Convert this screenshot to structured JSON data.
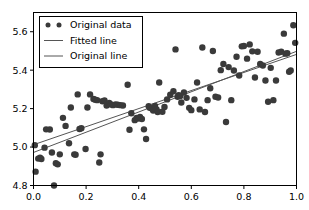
{
  "chart_data": {
    "type": "scatter",
    "title": "",
    "xlabel": "",
    "ylabel": "",
    "xlim": [
      0.0,
      1.0
    ],
    "ylim": [
      4.8,
      5.7
    ],
    "grid": false,
    "legend_position": "upper left",
    "xticks": [
      "0.0",
      "0.2",
      "0.4",
      "0.6",
      "0.8",
      "1.0"
    ],
    "xtick_values": [
      0.0,
      0.2,
      0.4,
      0.6,
      0.8,
      1.0
    ],
    "yticks": [
      "4.8",
      "5.0",
      "5.2",
      "5.4",
      "5.6"
    ],
    "ytick_values": [
      4.8,
      5.0,
      5.2,
      5.4,
      5.6
    ],
    "marker_color": "#3a3a3a",
    "marker_size": 4.2,
    "line_color": "#555555",
    "series": [
      {
        "name": "Original data",
        "type": "scatter",
        "marker": "circle",
        "color": "#3a3a3a",
        "points": [
          [
            0.005,
            5.01
          ],
          [
            0.008,
            4.872
          ],
          [
            0.018,
            4.94
          ],
          [
            0.025,
            4.945
          ],
          [
            0.03,
            4.938
          ],
          [
            0.042,
            4.997
          ],
          [
            0.048,
            5.092
          ],
          [
            0.062,
            5.091
          ],
          [
            0.07,
            4.972
          ],
          [
            0.078,
            4.8
          ],
          [
            0.085,
            4.916
          ],
          [
            0.092,
            4.91
          ],
          [
            0.1,
            4.962
          ],
          [
            0.112,
            5.152
          ],
          [
            0.122,
            5.11
          ],
          [
            0.135,
            5.02
          ],
          [
            0.142,
            5.206
          ],
          [
            0.155,
            4.962
          ],
          [
            0.16,
            4.96
          ],
          [
            0.168,
            5.274
          ],
          [
            0.175,
            5.094
          ],
          [
            0.182,
            5.098
          ],
          [
            0.198,
            4.99
          ],
          [
            0.205,
            5.206
          ],
          [
            0.215,
            5.274
          ],
          [
            0.228,
            5.25
          ],
          [
            0.235,
            5.246
          ],
          [
            0.242,
            5.244
          ],
          [
            0.25,
            4.92
          ],
          [
            0.255,
            4.962
          ],
          [
            0.262,
            5.238
          ],
          [
            0.27,
            5.242
          ],
          [
            0.278,
            5.216
          ],
          [
            0.288,
            5.23
          ],
          [
            0.295,
            5.222
          ],
          [
            0.302,
            5.218
          ],
          [
            0.312,
            5.222
          ],
          [
            0.32,
            5.22
          ],
          [
            0.33,
            5.218
          ],
          [
            0.34,
            5.216
          ],
          [
            0.358,
            5.324
          ],
          [
            0.365,
            5.09
          ],
          [
            0.372,
            5.176
          ],
          [
            0.385,
            5.14
          ],
          [
            0.392,
            5.152
          ],
          [
            0.398,
            5.148
          ],
          [
            0.405,
            5.156
          ],
          [
            0.412,
            5.146
          ],
          [
            0.42,
            5.092
          ],
          [
            0.428,
            5.042
          ],
          [
            0.438,
            5.212
          ],
          [
            0.442,
            5.204
          ],
          [
            0.45,
            5.2
          ],
          [
            0.455,
            5.19
          ],
          [
            0.462,
            5.214
          ],
          [
            0.468,
            5.196
          ],
          [
            0.472,
            5.182
          ],
          [
            0.478,
            5.336
          ],
          [
            0.49,
            5.184
          ],
          [
            0.498,
            5.208
          ],
          [
            0.508,
            5.248
          ],
          [
            0.52,
            5.272
          ],
          [
            0.532,
            5.29
          ],
          [
            0.54,
            5.508
          ],
          [
            0.548,
            5.262
          ],
          [
            0.552,
            5.27
          ],
          [
            0.558,
            5.266
          ],
          [
            0.562,
            5.232
          ],
          [
            0.572,
            5.284
          ],
          [
            0.582,
            5.256
          ],
          [
            0.592,
            5.204
          ],
          [
            0.6,
            5.192
          ],
          [
            0.612,
            5.248
          ],
          [
            0.622,
            5.336
          ],
          [
            0.632,
            5.196
          ],
          [
            0.642,
            5.518
          ],
          [
            0.652,
            5.182
          ],
          [
            0.662,
            5.244
          ],
          [
            0.672,
            5.306
          ],
          [
            0.682,
            5.5
          ],
          [
            0.692,
            5.262
          ],
          [
            0.702,
            5.258
          ],
          [
            0.712,
            5.4
          ],
          [
            0.722,
            5.432
          ],
          [
            0.732,
            5.13
          ],
          [
            0.742,
            5.416
          ],
          [
            0.752,
            5.244
          ],
          [
            0.762,
            5.398
          ],
          [
            0.772,
            5.47
          ],
          [
            0.782,
            5.372
          ],
          [
            0.792,
            5.524
          ],
          [
            0.8,
            5.526
          ],
          [
            0.812,
            5.46
          ],
          [
            0.822,
            5.534
          ],
          [
            0.832,
            5.498
          ],
          [
            0.842,
            5.362
          ],
          [
            0.852,
            5.496
          ],
          [
            0.862,
            5.432
          ],
          [
            0.872,
            5.424
          ],
          [
            0.882,
            5.346
          ],
          [
            0.892,
            5.236
          ],
          [
            0.902,
            5.412
          ],
          [
            0.912,
            5.244
          ],
          [
            0.922,
            5.346
          ],
          [
            0.932,
            5.492
          ],
          [
            0.942,
            5.496
          ],
          [
            0.952,
            5.59
          ],
          [
            0.958,
            5.486
          ],
          [
            0.965,
            5.488
          ],
          [
            0.972,
            5.392
          ],
          [
            0.978,
            5.398
          ],
          [
            0.988,
            5.634
          ],
          [
            0.995,
            5.542
          ]
        ]
      },
      {
        "name": "Fitted line",
        "type": "line",
        "color": "#555555",
        "x": [
          0.0,
          1.0
        ],
        "y": [
          5.012,
          5.482
        ]
      },
      {
        "name": "Original line",
        "type": "line",
        "color": "#555555",
        "x": [
          0.0,
          1.0
        ],
        "y": [
          4.972,
          5.498
        ]
      }
    ]
  },
  "legend": {
    "entries": [
      {
        "label": "Original data",
        "kind": "marker"
      },
      {
        "label": "Fitted line",
        "kind": "line"
      },
      {
        "label": "Original line",
        "kind": "line"
      }
    ]
  }
}
